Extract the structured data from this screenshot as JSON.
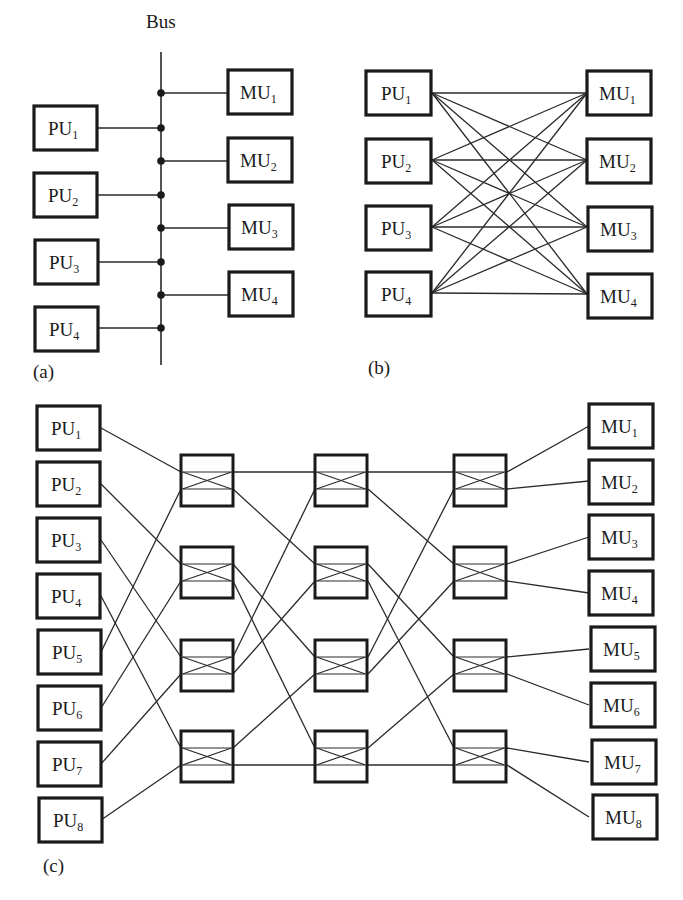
{
  "figure": {
    "panel_a": {
      "caption": "(a)",
      "bus_label": "Bus",
      "processors": [
        {
          "name": "PU",
          "index": "1"
        },
        {
          "name": "PU",
          "index": "2"
        },
        {
          "name": "PU",
          "index": "3"
        },
        {
          "name": "PU",
          "index": "4"
        }
      ],
      "memories": [
        {
          "name": "MU",
          "index": "1"
        },
        {
          "name": "MU",
          "index": "2"
        },
        {
          "name": "MU",
          "index": "3"
        },
        {
          "name": "MU",
          "index": "4"
        }
      ]
    },
    "panel_b": {
      "caption": "(b)",
      "processors": [
        {
          "name": "PU",
          "index": "1"
        },
        {
          "name": "PU",
          "index": "2"
        },
        {
          "name": "PU",
          "index": "3"
        },
        {
          "name": "PU",
          "index": "4"
        }
      ],
      "memories": [
        {
          "name": "MU",
          "index": "1"
        },
        {
          "name": "MU",
          "index": "2"
        },
        {
          "name": "MU",
          "index": "3"
        },
        {
          "name": "MU",
          "index": "4"
        }
      ]
    },
    "panel_c": {
      "caption": "(c)",
      "processors": [
        {
          "name": "PU",
          "index": "1"
        },
        {
          "name": "PU",
          "index": "2"
        },
        {
          "name": "PU",
          "index": "3"
        },
        {
          "name": "PU",
          "index": "4"
        },
        {
          "name": "PU",
          "index": "5"
        },
        {
          "name": "PU",
          "index": "6"
        },
        {
          "name": "PU",
          "index": "7"
        },
        {
          "name": "PU",
          "index": "8"
        }
      ],
      "memories": [
        {
          "name": "MU",
          "index": "1"
        },
        {
          "name": "MU",
          "index": "2"
        },
        {
          "name": "MU",
          "index": "3"
        },
        {
          "name": "MU",
          "index": "4"
        },
        {
          "name": "MU",
          "index": "5"
        },
        {
          "name": "MU",
          "index": "6"
        },
        {
          "name": "MU",
          "index": "7"
        },
        {
          "name": "MU",
          "index": "8"
        }
      ],
      "switch_stages": 3,
      "switches_per_stage": 4
    }
  }
}
